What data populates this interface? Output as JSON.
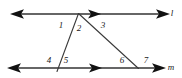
{
  "figure": {
    "type": "geometry-diagram",
    "width": 182,
    "height": 78,
    "background_color": "#ffffff",
    "stroke_color": "#555555",
    "text_color": "#1a1a1a"
  },
  "lines": [
    {
      "name": "line-l",
      "label": "l",
      "label_x": 172,
      "label_y": 13,
      "y": 14,
      "x_start": 13,
      "x_end": 167,
      "arrow_left": true,
      "arrow_right": true,
      "mid_arrow_x": 99
    },
    {
      "name": "line-m",
      "label": "m",
      "label_x": 171,
      "label_y": 67,
      "y": 68,
      "x_start": 9,
      "x_end": 163,
      "arrow_left": true,
      "arrow_right": true,
      "mid_arrow_x": 100
    }
  ],
  "transversals": [
    {
      "name": "transversal-left",
      "x1": 78,
      "y1": 14,
      "x2": 57,
      "y2": 71
    },
    {
      "name": "transversal-right",
      "x1": 78,
      "y1": 14,
      "x2": 138,
      "y2": 68
    }
  ],
  "vertices": [
    {
      "name": "apex-vertex",
      "x": 78,
      "y": 14
    },
    {
      "name": "left-base-vertex",
      "x": 59,
      "y": 68
    },
    {
      "name": "right-base-vertex",
      "x": 138,
      "y": 68
    }
  ],
  "angle_labels": [
    {
      "name": "angle-1",
      "text": "1",
      "x": 61,
      "y": 25
    },
    {
      "name": "angle-2",
      "text": "2",
      "x": 79,
      "y": 28
    },
    {
      "name": "angle-3",
      "text": "3",
      "x": 103,
      "y": 25
    },
    {
      "name": "angle-4",
      "text": "4",
      "x": 49,
      "y": 60
    },
    {
      "name": "angle-5",
      "text": "5",
      "x": 66,
      "y": 60
    },
    {
      "name": "angle-6",
      "text": "6",
      "x": 122,
      "y": 60
    },
    {
      "name": "angle-7",
      "text": "7",
      "x": 146,
      "y": 60
    }
  ]
}
